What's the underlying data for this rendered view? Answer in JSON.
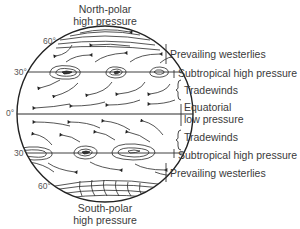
{
  "diagram": {
    "type": "global atmospheric circulation",
    "top_title": [
      "North-polar",
      "high pressure"
    ],
    "bottom_title": [
      "South-polar",
      "high pressure"
    ],
    "latitudes": [
      {
        "label": "60°",
        "hemisphere": "north"
      },
      {
        "label": "30°",
        "hemisphere": "north"
      },
      {
        "label": "0°",
        "hemisphere": "equator"
      },
      {
        "label": "30°",
        "hemisphere": "south"
      },
      {
        "label": "60°",
        "hemisphere": "south"
      }
    ],
    "zones": [
      {
        "label": "Prevailing westerlies"
      },
      {
        "label": "Subtropical high pressure"
      },
      {
        "label": "Tradewinds"
      },
      {
        "label": "Equatorial",
        "label2": "low pressure"
      },
      {
        "label": "Tradewinds"
      },
      {
        "label": "Subtropical high pressure"
      },
      {
        "label": "Prevailing westerlies"
      }
    ],
    "colors": {
      "line": "#2a2a2a",
      "text": "#3a3a3a"
    }
  }
}
